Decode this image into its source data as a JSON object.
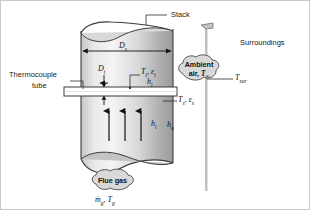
{
  "figure": {
    "background": "#ffffff",
    "border_color": "#c9c9c9"
  },
  "labels": {
    "stack": "Stack",
    "surroundings": "Surroundings",
    "thermocouple_line1": "Thermocouple",
    "thermocouple_line2": "tube"
  },
  "callouts": {
    "ambient": {
      "line1": "Ambient",
      "line2_prefix": "air, ",
      "line2_symbol": "T",
      "line2_sub": "∞",
      "fill": "#d9d9d9",
      "stroke": "#4a4a4a"
    },
    "flue_gas": {
      "label": "Flue gas",
      "fill": "#d9d9d9",
      "stroke": "#4a4a4a",
      "mdot_symbol": "ṁ",
      "mdot_sub": "g",
      "temp_symbol": "T",
      "temp_sub": "g"
    }
  },
  "symbols": {
    "stack_diameter": {
      "sym": "D",
      "sub": "s"
    },
    "tube_diameter": {
      "sym": "D",
      "sub": "t"
    },
    "tube_temp": {
      "sym": "T",
      "sub": "t"
    },
    "tube_emissivity": {
      "sym": "ε",
      "sub": "t"
    },
    "inner_coeff": {
      "sym": "h",
      "sub": "i"
    },
    "outer_coeff": {
      "sym": "h",
      "sub": "o"
    },
    "surface_temp": {
      "sym": "T",
      "sub": "s"
    },
    "surface_emissivity": {
      "sym": "ε",
      "sub": "s"
    },
    "surroundings_temp": {
      "sym": "T",
      "sub": "sur"
    }
  },
  "colors": {
    "stack_light": "#efefef",
    "stack_mid": "#d2d2d2",
    "stack_dark": "#9d9d9d",
    "outline": "#3c3c3c",
    "arrow": "#111111",
    "leader": "#2b2b2b",
    "wall": "#7a7a7a",
    "tube_fill": "#ffffff"
  },
  "geometry": {
    "stack_left_x": 80,
    "stack_right_x": 172,
    "stack_top_y": 22,
    "stack_bottom_y": 168,
    "wall_x": 205,
    "arrow_count": 3
  }
}
